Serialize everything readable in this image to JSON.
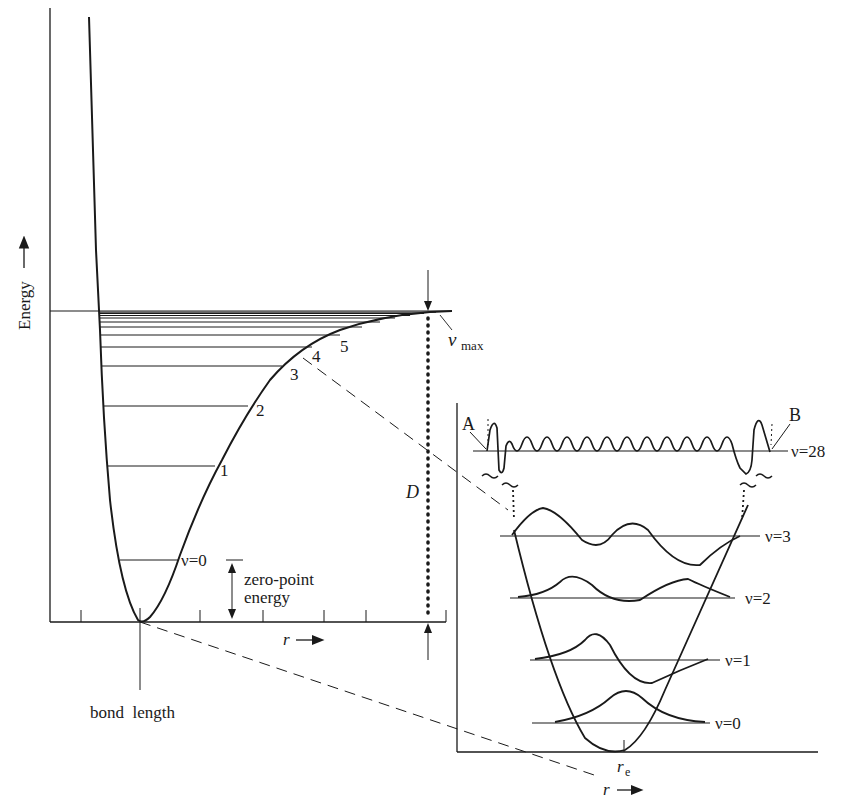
{
  "main_plot": {
    "y_axis_label": "Energy",
    "x_axis_label": "r",
    "level_labels": [
      "ν=0",
      "1",
      "2",
      "3",
      "4",
      "5"
    ],
    "v_max_label": "ν",
    "v_max_sub": "max",
    "dissociation_label": "D",
    "zero_point_label_line1": "zero-point",
    "zero_point_label_line2": "energy",
    "bond_length_label": "bond  length"
  },
  "inset": {
    "level_labels": [
      "ν=0",
      "ν=1",
      "ν=2",
      "ν=3",
      "ν=28"
    ],
    "turning_point_a": "A",
    "turning_point_b": "B",
    "equilibrium_label": "r",
    "equilibrium_sub": "e",
    "x_axis_label": "r"
  },
  "colors": {
    "ink": "#1a1a1a",
    "background": "#ffffff"
  }
}
